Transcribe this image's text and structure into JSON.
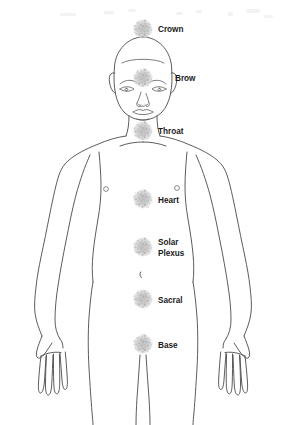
{
  "diagram": {
    "colors": {
      "background": "#ffffff",
      "outline": "#4a4a4a",
      "label_text": "#1a1a1a",
      "chakra_fill": "#c8c8c8"
    },
    "chakras": [
      {
        "id": "crown",
        "label": "Crown",
        "cx": 143,
        "cy": 29,
        "r": 10,
        "label_x": 158,
        "label_y": 32,
        "lines": 1
      },
      {
        "id": "brow",
        "label": "Brow",
        "cx": 143,
        "cy": 78,
        "r": 10,
        "label_x": 175,
        "label_y": 81,
        "lines": 1
      },
      {
        "id": "throat",
        "label": "Throat",
        "cx": 143,
        "cy": 131,
        "r": 10,
        "label_x": 158,
        "label_y": 134,
        "lines": 1
      },
      {
        "id": "heart",
        "label": "Heart",
        "cx": 143,
        "cy": 199,
        "r": 10,
        "label_x": 158,
        "label_y": 203,
        "lines": 1
      },
      {
        "id": "solar-plexus",
        "label": "Solar Plexus",
        "label_line_1": "Solar",
        "label_line_2": "Plexus",
        "cx": 143,
        "cy": 247,
        "r": 10,
        "label_x": 158,
        "label_y": 245,
        "lines": 2
      },
      {
        "id": "sacral",
        "label": "Sacral",
        "cx": 143,
        "cy": 299,
        "r": 10,
        "label_x": 158,
        "label_y": 303,
        "lines": 1
      },
      {
        "id": "base",
        "label": "Base",
        "cx": 143,
        "cy": 344,
        "r": 10,
        "label_x": 158,
        "label_y": 348,
        "lines": 1
      }
    ]
  }
}
